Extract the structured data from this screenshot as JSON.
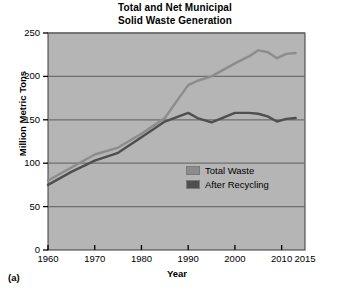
{
  "figure": {
    "panel_label": "(a)"
  },
  "chart_data": {
    "type": "line",
    "title": "Total and Net Municipal Solid Waste Generation",
    "title_lines": [
      "Total and Net Municipal",
      "Solid Waste Generation"
    ],
    "xlabel": "Year",
    "ylabel": "Million Metric Tons",
    "xlim": [
      1960,
      2015
    ],
    "ylim": [
      0,
      250
    ],
    "xticks": [
      1960,
      1970,
      1980,
      1990,
      2000,
      2010,
      2015
    ],
    "xtick_labels": [
      "1960",
      "1970",
      "1980",
      "1990",
      "2000",
      "2010",
      "2015"
    ],
    "yticks": [
      0,
      50,
      100,
      150,
      200,
      250
    ],
    "ytick_labels": [
      "0",
      "50",
      "100",
      "150",
      "200",
      "250"
    ],
    "grid": "horizontal",
    "gridlines_at": [
      50,
      100,
      150,
      200,
      250
    ],
    "legend_position": "inside-center-right",
    "plot_background": "#b5b5b5",
    "gridline_color": "#6e6e6e",
    "series": [
      {
        "name": "Total Waste",
        "color": "#8c8c8c",
        "x": [
          1960,
          1965,
          1970,
          1975,
          1980,
          1985,
          1988,
          1990,
          1992,
          1995,
          2000,
          2003,
          2005,
          2007,
          2009,
          2011,
          2013
        ],
        "values": [
          80,
          95,
          110,
          118,
          134,
          152,
          175,
          190,
          195,
          200,
          215,
          223,
          230,
          228,
          221,
          226,
          227
        ]
      },
      {
        "name": "After Recycling",
        "color": "#4f4f4f",
        "x": [
          1960,
          1965,
          1970,
          1975,
          1980,
          1985,
          1988,
          1990,
          1992,
          1995,
          2000,
          2003,
          2005,
          2007,
          2009,
          2011,
          2013
        ],
        "values": [
          75,
          90,
          103,
          112,
          130,
          148,
          154,
          158,
          152,
          147,
          158,
          158,
          157,
          154,
          148,
          151,
          152
        ]
      }
    ]
  },
  "legend": {
    "items": [
      {
        "label": "Total Waste",
        "color": "#8c8c8c"
      },
      {
        "label": "After Recycling",
        "color": "#4f4f4f"
      }
    ]
  }
}
